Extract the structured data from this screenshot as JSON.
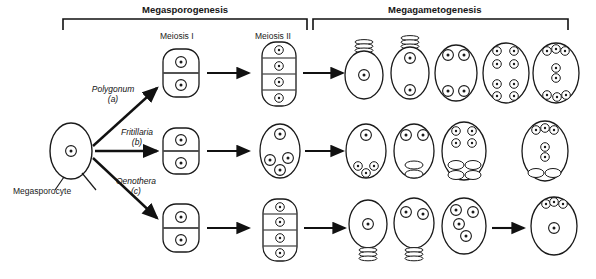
{
  "figure": {
    "title_sections": [
      {
        "id": "megasporogenesis",
        "label": "Megasporogenesis"
      },
      {
        "id": "megagametogenesis",
        "label": "Megagametogenesis"
      }
    ],
    "stage_labels": [
      {
        "id": "meiosis-1",
        "label": "Meiosis I"
      },
      {
        "id": "meiosis-2",
        "label": "Meiosis II"
      }
    ],
    "origin_cell": {
      "label": "Megasporocyte"
    },
    "pathways": [
      {
        "id": "polygonum",
        "name": "Polygonum",
        "letter": "(a)"
      },
      {
        "id": "fritillaria",
        "name": "Fritillaria",
        "letter": "(b)"
      },
      {
        "id": "oenothera",
        "name": "Oenothera",
        "letter": "(c)"
      }
    ],
    "colors": {
      "ink": "#111111",
      "background": "#ffffff",
      "cell_outline": "#1a1a1a"
    }
  },
  "diagram_data": {
    "type": "biological-process-diagram",
    "subject": "Embryo sac (megagametophyte) development patterns in angiosperms",
    "rows": [
      {
        "pathway": "Polygonum",
        "letter": "(a)",
        "meiosis_1_cells": 2,
        "meiosis_2_cells": 4,
        "gametogenesis_nuclei": [
          1,
          2,
          4,
          8,
          8
        ],
        "degenerating_megaspores": 3,
        "mature_sac": "7-celled, 8-nucleate: 3 antipodals, 2 polar nuclei, egg + 2 synergids"
      },
      {
        "pathway": "Fritillaria",
        "letter": "(b)",
        "meiosis_1_cells": 2,
        "meiosis_2_cells": 4,
        "gametogenesis_nuclei": [
          4,
          4,
          8,
          8
        ],
        "degenerating_megaspores": 0,
        "mature_sac": "4-nucleate chalazal group fuses; 8-nucleate bipolar sac"
      },
      {
        "pathway": "Oenothera",
        "letter": "(c)",
        "meiosis_1_cells": 2,
        "meiosis_2_cells": 4,
        "gametogenesis_nuclei": [
          1,
          2,
          4,
          4
        ],
        "degenerating_megaspores": 3,
        "mature_sac": "4-nucleate: egg + 2 synergids + 1 polar nucleus"
      }
    ]
  }
}
